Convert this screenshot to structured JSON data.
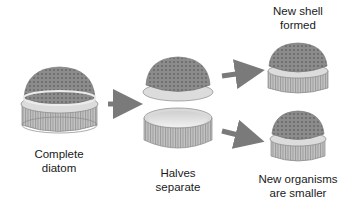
{
  "diagram": {
    "stages": [
      {
        "id": "complete",
        "label_line1": "Complete",
        "label_line2": "diatom"
      },
      {
        "id": "halves",
        "label_line1": "Halves",
        "label_line2": "separate"
      },
      {
        "id": "new-shell",
        "label_line1": "New shell",
        "label_line2": "formed"
      },
      {
        "id": "smaller",
        "label_line1": "New organisms",
        "label_line2": "are smaller"
      }
    ],
    "colors": {
      "shell_top": "#8a8a8a",
      "shell_rim": "#d8d8d8",
      "shell_band": "#b5b5b5",
      "arrow": "#7a7a7a",
      "inner": "#e6e6e6"
    }
  }
}
